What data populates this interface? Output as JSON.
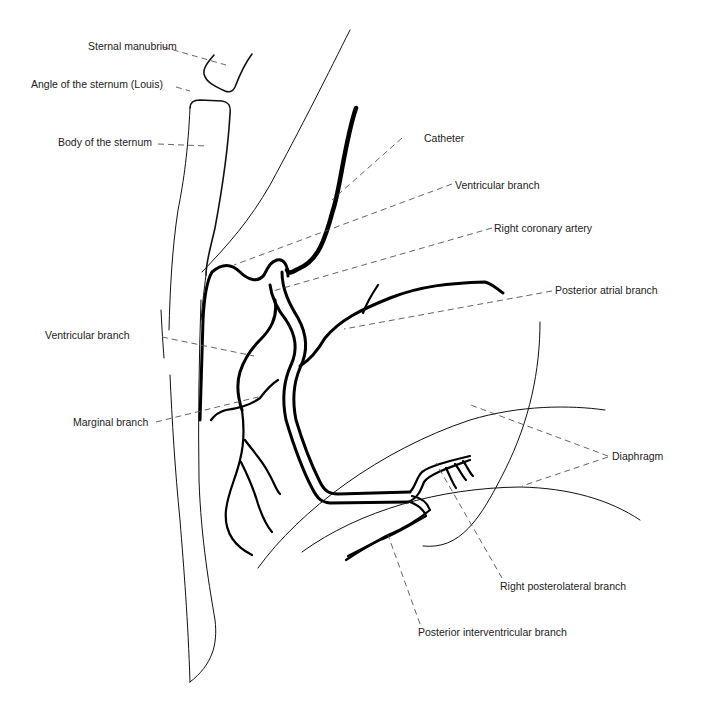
{
  "figure": {
    "colors": {
      "line": "#000000",
      "leader": "#555555",
      "text": "#222222",
      "background": "#ffffff"
    }
  },
  "labels": {
    "sternal_manubrium": "Sternal manubrium",
    "angle_of_sternum": "Angle of the sternum (Louis)",
    "body_of_sternum": "Body of the sternum",
    "catheter": "Catheter",
    "ventricular_branch_upper": "Ventricular branch",
    "right_coronary_artery": "Right coronary artery",
    "posterior_atrial_branch": "Posterior atrial branch",
    "ventricular_branch_left": "Ventricular branch",
    "marginal_branch": "Marginal branch",
    "diaphragm": "Diaphragm",
    "right_posterolateral_branch": "Right posterolateral branch",
    "posterior_interventricular_branch": "Posterior interventricular branch"
  }
}
